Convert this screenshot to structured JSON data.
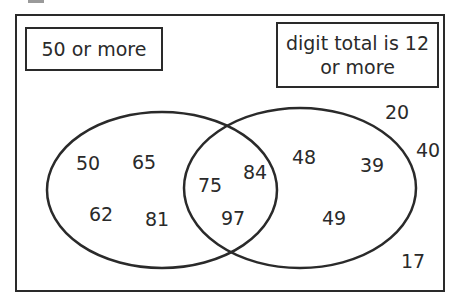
{
  "diagram": {
    "type": "venn",
    "sets": [
      {
        "name": "left",
        "label": "50 or more"
      },
      {
        "name": "right",
        "label": "digit total is 12 or more"
      }
    ],
    "regions": {
      "left_only": [
        "50",
        "65",
        "62",
        "81"
      ],
      "intersection": [
        "75",
        "84",
        "97"
      ],
      "right_only": [
        "48",
        "39",
        "49"
      ],
      "outside": [
        "20",
        "40",
        "17"
      ]
    }
  },
  "labels": {
    "left_set": "50 or more",
    "right_set": "digit total is 12 or more"
  },
  "numbers": {
    "n50": "50",
    "n65": "65",
    "n62": "62",
    "n81": "81",
    "n75": "75",
    "n84": "84",
    "n97": "97",
    "n48": "48",
    "n39": "39",
    "n49": "49",
    "n20": "20",
    "n40": "40",
    "n17": "17"
  },
  "colors": {
    "stroke": "#2a2a2a",
    "background": "#ffffff"
  }
}
